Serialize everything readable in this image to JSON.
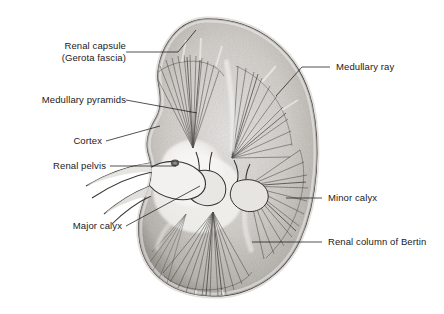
{
  "figure": {
    "background_color": "#ffffff",
    "ink_color": "#1a1a1a",
    "tissue_light": "#d8d6d2",
    "tissue_mid": "#b3b0ab",
    "tissue_dark": "#6f6c68",
    "labels": [
      {
        "id": "renal-capsule",
        "line1": "Renal capsule",
        "line2": "(Gerota fascia)",
        "side": "left"
      },
      {
        "id": "medullary-pyramids",
        "line1": "Medullary pyramids",
        "line2": "",
        "side": "left"
      },
      {
        "id": "cortex",
        "line1": "Cortex",
        "line2": "",
        "side": "left"
      },
      {
        "id": "renal-pelvis",
        "line1": "Renal pelvis",
        "line2": "",
        "side": "left"
      },
      {
        "id": "major-calyx",
        "line1": "Major calyx",
        "line2": "",
        "side": "left"
      },
      {
        "id": "medullary-ray",
        "line1": "Medullary ray",
        "line2": "",
        "side": "right"
      },
      {
        "id": "minor-calyx",
        "line1": "Minor calyx",
        "line2": "",
        "side": "right"
      },
      {
        "id": "renal-column-of-bertin",
        "line1": "Renal column of Bertin",
        "line2": "",
        "side": "right"
      }
    ]
  }
}
